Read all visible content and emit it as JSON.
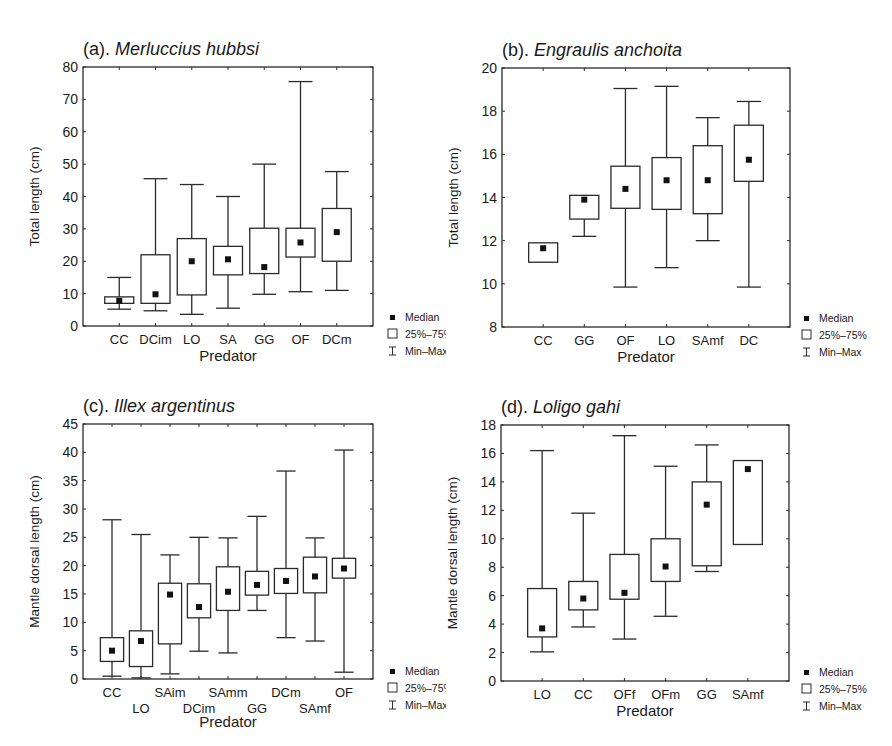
{
  "figure": {
    "legend": {
      "median_label": "Median",
      "box_label": "25%–75%",
      "whisker_label": "Min–Max"
    },
    "xlabel": "Predator"
  },
  "chart_data": [
    {
      "id": "a",
      "type": "box",
      "title_prefix": "(a). ",
      "title_species": "Merluccius hubbsi",
      "xlabel": "Predator",
      "ylabel": "Total length (cm)",
      "ylim": [
        0,
        80
      ],
      "yticks": [
        0,
        10,
        20,
        30,
        40,
        50,
        60,
        70,
        80
      ],
      "staggered_labels": false,
      "categories": [
        "CC",
        "DCim",
        "LO",
        "SA",
        "GG",
        "OF",
        "DCm"
      ],
      "series": [
        {
          "name": "CC",
          "min": 5.2,
          "q1": 7.0,
          "median": 7.8,
          "q3": 9.0,
          "max": 15.0
        },
        {
          "name": "DCim",
          "min": 4.7,
          "q1": 7.0,
          "median": 9.8,
          "q3": 22.0,
          "max": 45.5
        },
        {
          "name": "LO",
          "min": 3.6,
          "q1": 9.6,
          "median": 20.0,
          "q3": 27.0,
          "max": 43.7
        },
        {
          "name": "SA",
          "min": 5.5,
          "q1": 15.8,
          "median": 20.6,
          "q3": 24.6,
          "max": 40.0
        },
        {
          "name": "GG",
          "min": 9.8,
          "q1": 16.2,
          "median": 18.2,
          "q3": 30.2,
          "max": 50.0
        },
        {
          "name": "OF",
          "min": 10.6,
          "q1": 21.3,
          "median": 25.8,
          "q3": 30.2,
          "max": 75.5
        },
        {
          "name": "DCm",
          "min": 11.0,
          "q1": 20.0,
          "median": 29.0,
          "q3": 36.3,
          "max": 47.7
        }
      ]
    },
    {
      "id": "b",
      "type": "box",
      "title_prefix": "(b). ",
      "title_species": "Engraulis anchoita",
      "xlabel": "Predator",
      "ylabel": "Total length (cm)",
      "ylim": [
        8,
        20
      ],
      "yticks": [
        8,
        10,
        12,
        14,
        16,
        18,
        20
      ],
      "staggered_labels": false,
      "categories": [
        "CC",
        "GG",
        "OF",
        "LO",
        "SAmf",
        "DC"
      ],
      "series": [
        {
          "name": "CC",
          "min": 11.0,
          "q1": 11.0,
          "median": 11.65,
          "q3": 11.9,
          "max": 11.9
        },
        {
          "name": "GG",
          "min": 12.2,
          "q1": 13.0,
          "median": 13.9,
          "q3": 14.1,
          "max": 14.1
        },
        {
          "name": "OF",
          "min": 9.85,
          "q1": 13.5,
          "median": 14.4,
          "q3": 15.45,
          "max": 19.05
        },
        {
          "name": "LO",
          "min": 10.75,
          "q1": 13.45,
          "median": 14.8,
          "q3": 15.85,
          "max": 19.15
        },
        {
          "name": "SAmf",
          "min": 12.0,
          "q1": 13.25,
          "median": 14.8,
          "q3": 16.4,
          "max": 17.7
        },
        {
          "name": "DC",
          "min": 9.85,
          "q1": 14.75,
          "median": 15.75,
          "q3": 17.35,
          "max": 18.45
        }
      ]
    },
    {
      "id": "c",
      "type": "box",
      "title_prefix": "(c). ",
      "title_species": "Illex argentinus",
      "xlabel": "Predator",
      "ylabel": "Mantle dorsal length (cm)",
      "ylim": [
        0,
        45
      ],
      "yticks": [
        0,
        5,
        10,
        15,
        20,
        25,
        30,
        35,
        40,
        45
      ],
      "staggered_labels": true,
      "categories": [
        "CC",
        "LO",
        "SAim",
        "DCim",
        "SAmm",
        "GG",
        "DCm",
        "SAmf",
        "OF"
      ],
      "series": [
        {
          "name": "CC",
          "min": 0.5,
          "q1": 3.1,
          "median": 5.0,
          "q3": 7.3,
          "max": 28.1
        },
        {
          "name": "LO",
          "min": 0.2,
          "q1": 2.2,
          "median": 6.7,
          "q3": 8.5,
          "max": 25.5
        },
        {
          "name": "SAim",
          "min": 0.9,
          "q1": 6.2,
          "median": 14.9,
          "q3": 16.9,
          "max": 21.9
        },
        {
          "name": "DCim",
          "min": 4.9,
          "q1": 10.8,
          "median": 12.7,
          "q3": 16.8,
          "max": 25.0
        },
        {
          "name": "SAmm",
          "min": 4.6,
          "q1": 12.1,
          "median": 15.4,
          "q3": 19.8,
          "max": 24.9
        },
        {
          "name": "GG",
          "min": 12.1,
          "q1": 14.8,
          "median": 16.6,
          "q3": 19.0,
          "max": 28.7
        },
        {
          "name": "DCm",
          "min": 7.3,
          "q1": 15.1,
          "median": 17.3,
          "q3": 19.5,
          "max": 36.7
        },
        {
          "name": "SAmf",
          "min": 6.7,
          "q1": 15.2,
          "median": 18.1,
          "q3": 21.5,
          "max": 24.9
        },
        {
          "name": "OF",
          "min": 1.2,
          "q1": 17.8,
          "median": 19.5,
          "q3": 21.3,
          "max": 40.4
        }
      ]
    },
    {
      "id": "d",
      "type": "box",
      "title_prefix": "(d). ",
      "title_species": "Loligo gahi",
      "xlabel": "Predator",
      "ylabel": "Mantle dorsal length (cm)",
      "ylim": [
        0,
        18
      ],
      "yticks": [
        0,
        2,
        4,
        6,
        8,
        10,
        12,
        14,
        16,
        18
      ],
      "staggered_labels": false,
      "categories": [
        "LO",
        "CC",
        "OFf",
        "OFm",
        "GG",
        "SAmf"
      ],
      "series": [
        {
          "name": "LO",
          "min": 2.05,
          "q1": 3.1,
          "median": 3.7,
          "q3": 6.5,
          "max": 16.2
        },
        {
          "name": "CC",
          "min": 3.8,
          "q1": 5.0,
          "median": 5.8,
          "q3": 7.0,
          "max": 11.8
        },
        {
          "name": "OFf",
          "min": 2.95,
          "q1": 5.75,
          "median": 6.2,
          "q3": 8.9,
          "max": 17.25
        },
        {
          "name": "OFm",
          "min": 4.55,
          "q1": 7.0,
          "median": 8.05,
          "q3": 10.0,
          "max": 15.1
        },
        {
          "name": "GG",
          "min": 7.7,
          "q1": 8.1,
          "median": 12.4,
          "q3": 14.0,
          "max": 16.6
        },
        {
          "name": "SAmf",
          "min": 9.6,
          "q1": 9.6,
          "median": 14.9,
          "q3": 15.5,
          "max": 15.5
        }
      ]
    }
  ]
}
